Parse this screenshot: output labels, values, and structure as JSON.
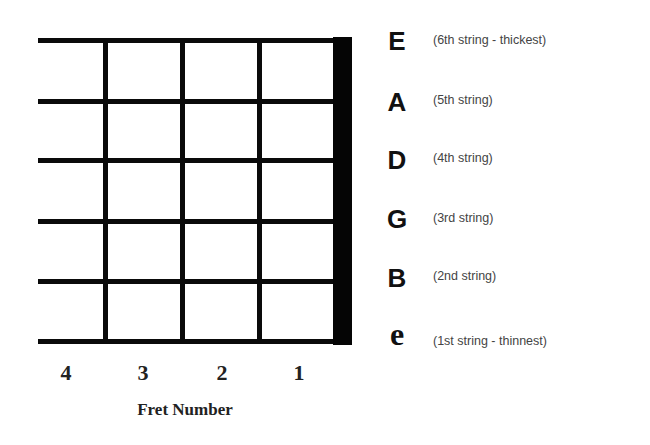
{
  "diagram": {
    "strings": [
      {
        "letter": "E",
        "description": "(6th string - thickest)"
      },
      {
        "letter": "A",
        "description": "(5th string)"
      },
      {
        "letter": "D",
        "description": "(4th string)"
      },
      {
        "letter": "G",
        "description": "(3rd string)"
      },
      {
        "letter": "B",
        "description": "(2nd string)"
      },
      {
        "letter": "e",
        "description": "(1st string - thinnest)"
      }
    ],
    "frets": [
      "4",
      "3",
      "2",
      "1"
    ],
    "fret_caption": "Fret Number",
    "colors": {
      "lines": "#0a0a0a",
      "background": "#ffffff",
      "description_text": "#444444"
    }
  }
}
